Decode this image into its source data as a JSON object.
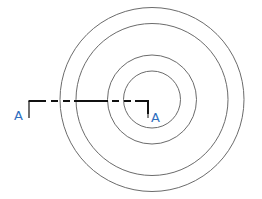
{
  "diagram": {
    "center": {
      "x": 152,
      "y": 99.5
    },
    "circles": [
      {
        "id": "outer",
        "r": 92
      },
      {
        "id": "second",
        "r": 76
      },
      {
        "id": "third",
        "r": 44.5
      },
      {
        "id": "inner",
        "r": 28.5
      }
    ],
    "section_line": {
      "y": 101,
      "x_start": 29,
      "x_end": 149,
      "tick_bottom": 118,
      "label_left": "A",
      "label_right": "A"
    },
    "colors": {
      "circle_stroke": "#6b6b6b",
      "section_stroke": "#111111",
      "label": "#2f6fc0",
      "background": "#ffffff"
    }
  }
}
